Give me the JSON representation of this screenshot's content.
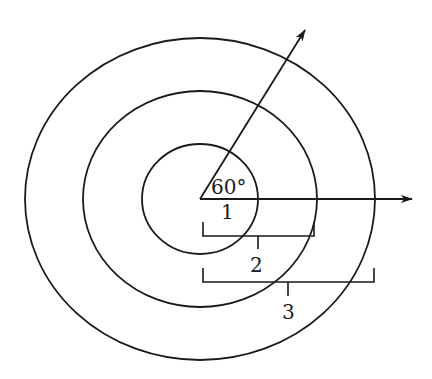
{
  "diagram": {
    "type": "concentric-circles-with-angle",
    "stroke_color": "#1a1a1a",
    "background": "#ffffff",
    "angle_label": "60°",
    "circles": [
      {
        "id": 1,
        "label": "1",
        "cx": 200,
        "cy": 199,
        "rx": 58,
        "ry": 55
      },
      {
        "id": 2,
        "label": "2",
        "cx": 200,
        "cy": 199,
        "rx": 117,
        "ry": 108
      },
      {
        "id": 3,
        "label": "3",
        "cx": 200,
        "cy": 199,
        "rx": 175,
        "ry": 161
      }
    ],
    "arrows": [
      {
        "name": "horizontal-ray",
        "from": [
          200,
          199
        ],
        "to": [
          412,
          199
        ]
      },
      {
        "name": "angled-ray-60deg",
        "from": [
          200,
          199
        ],
        "to": [
          305,
          30
        ]
      }
    ],
    "radius_labels": {
      "r1": "1",
      "r2": "2",
      "r3": "3"
    }
  }
}
